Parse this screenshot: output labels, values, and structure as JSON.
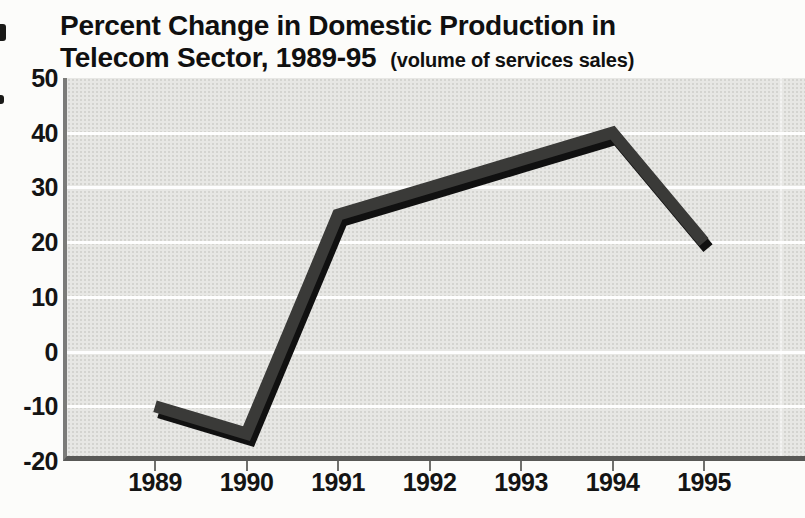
{
  "title": {
    "line1": "Percent Change in Domestic Production in",
    "line2": "Telecom Sector, 1989-95",
    "subtitle": "(volume of services sales)"
  },
  "chart_data": {
    "type": "line",
    "title": "Percent Change in Domestic Production in Telecom Sector, 1989-95",
    "subtitle": "(volume of services sales)",
    "categories": [
      "1989",
      "1990",
      "1991",
      "1992",
      "1993",
      "1994",
      "1995"
    ],
    "series": [
      {
        "name": "Percent change in domestic production (volume of services sales)",
        "values": [
          -10,
          -15,
          25,
          30,
          35,
          40,
          20
        ]
      }
    ],
    "xlabel": "",
    "ylabel": "",
    "ylim": [
      -20,
      50
    ],
    "yticks": [
      50,
      40,
      30,
      20,
      10,
      0,
      -10,
      -20
    ],
    "grid": "horizontal",
    "legend_position": "none",
    "colors": {
      "line": "#3a3a38",
      "line_shadow": "#101010",
      "plot_background": "#e7e7e4",
      "gridline": "#ffffff",
      "axis_bottom": "#585856",
      "axis_left": "#7b7b78",
      "text": "#141414",
      "page_background": "#fcfcfa"
    }
  }
}
